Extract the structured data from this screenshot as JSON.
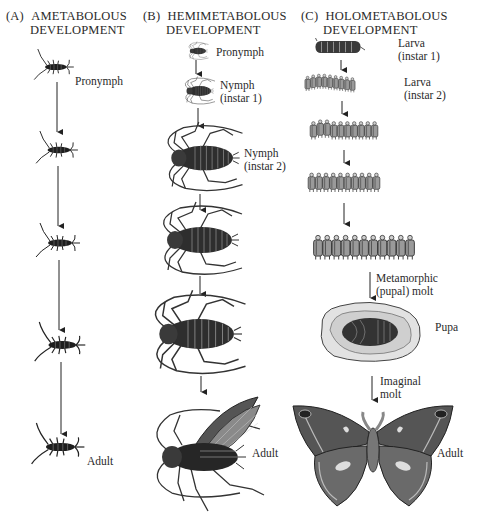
{
  "figure": {
    "columns": [
      {
        "id": "A",
        "letter": "(A)",
        "title_line1": "AMETABOLOUS",
        "title_line2": "DEVELOPMENT",
        "stages": [
          {
            "label": "Pronymph"
          },
          {
            "label": ""
          },
          {
            "label": ""
          },
          {
            "label": ""
          },
          {
            "label": "Adult"
          }
        ]
      },
      {
        "id": "B",
        "letter": "(B)",
        "title_line1": "HEMIMETABOLOUS",
        "title_line2": "DEVELOPMENT",
        "stages": [
          {
            "label": "Pronymph"
          },
          {
            "label": "Nymph",
            "sublabel": "(instar 1)"
          },
          {
            "label": "Nymph",
            "sublabel": "(instar 2)"
          },
          {
            "label": ""
          },
          {
            "label": ""
          },
          {
            "label": "Adult"
          }
        ]
      },
      {
        "id": "C",
        "letter": "(C)",
        "title_line1": "HOLOMETABOLOUS",
        "title_line2": "DEVELOPMENT",
        "stages": [
          {
            "label": "Larva",
            "sublabel": "(instar 1)"
          },
          {
            "label": "Larva",
            "sublabel": "(instar 2)"
          },
          {
            "label": ""
          },
          {
            "label": ""
          },
          {
            "label": ""
          },
          {
            "label": "Pupa"
          },
          {
            "label": "Adult"
          }
        ],
        "transitions": [
          {
            "label": "Metamorphic",
            "sublabel": "(pupal) molt"
          },
          {
            "label": "Imaginal",
            "sublabel": "molt"
          }
        ]
      }
    ]
  }
}
